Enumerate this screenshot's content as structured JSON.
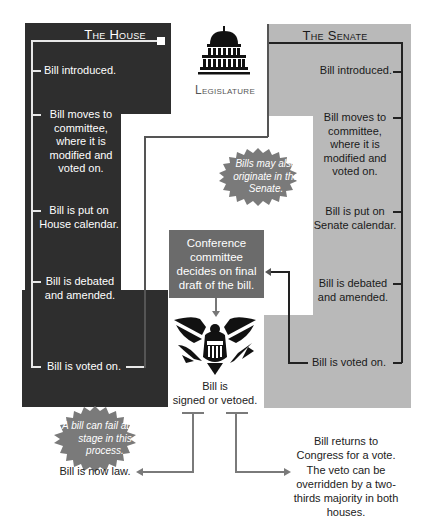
{
  "house": {
    "title": "The House",
    "steps": [
      "Bill introduced.",
      "Bill moves to committee, where it is modified and voted on.",
      "Bill is put on House calendar.",
      "Bill is debated and amended.",
      "Bill is voted on."
    ],
    "color": "#2e2e2e"
  },
  "senate": {
    "title": "The Senate",
    "steps": [
      "Bill introduced.",
      "Bill moves to committee, where it is modified and voted on.",
      "Bill is put on Senate calendar.",
      "Bill is debated and amended.",
      "Bill is voted on."
    ],
    "color": "#b9b9b9"
  },
  "legislature": {
    "label": "Legislature",
    "icon": "capitol-building-icon"
  },
  "callouts": {
    "senate_origin": "Bills may also originate in the Senate.",
    "fail": "A bill can fail at any stage in this process."
  },
  "conference": {
    "text": "Conference committee decides on final draft of the bill."
  },
  "executive": {
    "icon": "presidential-eagle-icon",
    "label_line1": "Bill is",
    "label_line2": "signed or vetoed."
  },
  "outcomes": {
    "law": "Bill is now law.",
    "veto": "Bill returns to Congress for a vote. The veto can be overridden by a two-thirds majority in both houses."
  }
}
